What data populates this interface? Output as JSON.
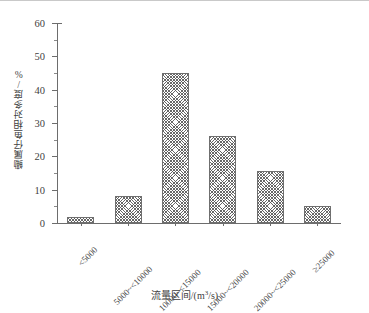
{
  "chart_data": {
    "type": "bar",
    "title": "",
    "subtitle": "",
    "xlabel": "流量区间/(m³/s)",
    "ylabel": "鳓属仔鱼相对多度/%",
    "categories": [
      "<5000",
      "5000~<10000",
      "10000~<15000",
      "15000~<20000",
      "20000~<25000",
      "≥25000"
    ],
    "values": [
      1.8,
      8.0,
      45.0,
      26.2,
      15.5,
      5.0
    ],
    "ylim": [
      0,
      60
    ],
    "ytick_values": [
      0,
      10,
      20,
      30,
      40,
      50,
      60
    ],
    "ytick_labels": [
      "0",
      "10",
      "20",
      "30",
      "40",
      "50",
      "60"
    ],
    "yminor_values": [
      5,
      15,
      25,
      35,
      45,
      55
    ],
    "grid": false,
    "legend": null,
    "bar_fill": "#ffffff",
    "bar_hatch": "crosshatch",
    "bar_edge_color": "#6f6f6f",
    "axis_color": "#6d6d6d",
    "text_color": "#3f3f3f",
    "background": "#ffffff",
    "xtick_rotation": 45
  },
  "axis": {
    "x_title": "流量区间/(m³/s)",
    "x_title_main": "流量区间/(m",
    "x_title_sup": "3",
    "x_title_tail": "/s)",
    "y_title": "鳓属仔鱼相对多度/%"
  }
}
